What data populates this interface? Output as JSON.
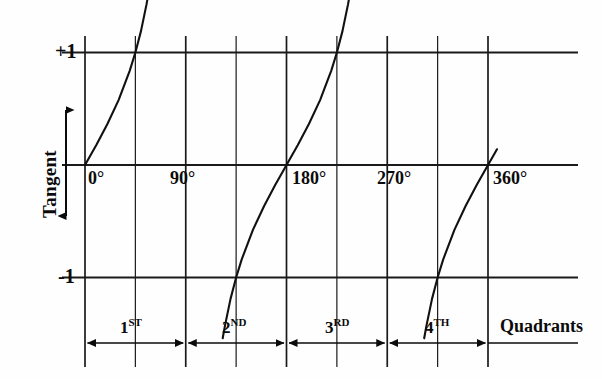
{
  "chart_data": {
    "type": "line",
    "title": "",
    "subtitle": "",
    "xlabel": "",
    "ylabel": "Tangent",
    "right_label": "Quadrants",
    "x_unit": "degrees",
    "xlim": [
      -10,
      395
    ],
    "ylim": [
      -1.55,
      1.55
    ],
    "grid": true,
    "grid_orientation": "both",
    "legend": "none",
    "x_ticks": [
      {
        "value": 0,
        "label": "0°"
      },
      {
        "value": 90,
        "label": "90°"
      },
      {
        "value": 180,
        "label": "180°"
      },
      {
        "value": 270,
        "label": "270°"
      },
      {
        "value": 360,
        "label": "360°"
      }
    ],
    "x_gridlines_deg": [
      0,
      45,
      90,
      135,
      180,
      225,
      270,
      315,
      360
    ],
    "y_ticks": [
      {
        "value": 1,
        "label": "+1"
      },
      {
        "value": 0,
        "label": ""
      },
      {
        "value": -1,
        "label": "-1"
      }
    ],
    "y_gridlines": [
      1,
      0,
      -1
    ],
    "series": [
      {
        "name": "tangent-branch-1",
        "x_range_deg": [
          0,
          58
        ],
        "points_deg": [
          [
            0,
            0.0
          ],
          [
            10,
            0.176
          ],
          [
            20,
            0.364
          ],
          [
            30,
            0.577
          ],
          [
            40,
            0.839
          ],
          [
            45,
            1.0
          ],
          [
            50,
            1.19
          ],
          [
            55,
            1.43
          ],
          [
            58,
            1.6
          ]
        ]
      },
      {
        "name": "tangent-branch-2",
        "x_range_deg": [
          123,
          238
        ],
        "points_deg": [
          [
            123,
            -1.54
          ],
          [
            125,
            -1.43
          ],
          [
            130,
            -1.19
          ],
          [
            135,
            -1.0
          ],
          [
            140,
            -0.839
          ],
          [
            150,
            -0.577
          ],
          [
            160,
            -0.364
          ],
          [
            170,
            -0.176
          ],
          [
            180,
            0.0
          ],
          [
            190,
            0.176
          ],
          [
            200,
            0.364
          ],
          [
            210,
            0.577
          ],
          [
            220,
            0.839
          ],
          [
            225,
            1.0
          ],
          [
            230,
            1.19
          ],
          [
            235,
            1.43
          ],
          [
            238,
            1.6
          ]
        ]
      },
      {
        "name": "tangent-branch-3",
        "x_range_deg": [
          303,
          368
        ],
        "points_deg": [
          [
            303,
            -1.54
          ],
          [
            305,
            -1.43
          ],
          [
            310,
            -1.19
          ],
          [
            315,
            -1.0
          ],
          [
            320,
            -0.839
          ],
          [
            330,
            -0.577
          ],
          [
            340,
            -0.364
          ],
          [
            350,
            -0.176
          ],
          [
            360,
            0.0
          ],
          [
            365,
            0.087
          ],
          [
            368,
            0.14
          ]
        ]
      }
    ],
    "quadrants": [
      {
        "ordinal": "1",
        "suffix": "ST",
        "from_deg": 0,
        "to_deg": 90
      },
      {
        "ordinal": "2",
        "suffix": "ND",
        "from_deg": 90,
        "to_deg": 180
      },
      {
        "ordinal": "3",
        "suffix": "RD",
        "from_deg": 180,
        "to_deg": 270
      },
      {
        "ordinal": "4",
        "suffix": "TH",
        "from_deg": 270,
        "to_deg": 360
      }
    ],
    "colors": {
      "ink": "#0b0b0b",
      "curve": "#111111",
      "grid": "#1a1a1a",
      "background": "#fefefe"
    }
  }
}
